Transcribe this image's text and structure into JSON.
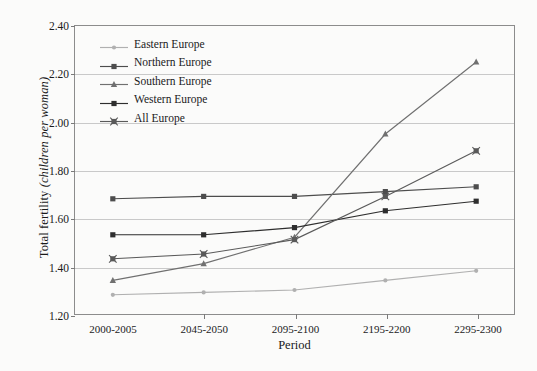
{
  "chart_data": {
    "type": "line",
    "title": "",
    "xlabel": "Period",
    "ylabel": "Total fertility (children per woman)",
    "ylabel_plain": "Total fertility",
    "ylabel_italic": "(children per woman)",
    "categories": [
      "2000-2005",
      "2045-2050",
      "2095-2100",
      "2195-2200",
      "2295-2300"
    ],
    "ylim": [
      1.2,
      2.4
    ],
    "ytick_labels": [
      "1.20",
      "1.40",
      "1.60",
      "1.80",
      "2.00",
      "2.20",
      "2.40"
    ],
    "ytick_values": [
      1.2,
      1.4,
      1.6,
      1.8,
      2.0,
      2.2,
      2.4
    ],
    "grid": true,
    "grid_axis": "y",
    "legend_position": "top-left",
    "series": [
      {
        "name": "Eastern Europe",
        "marker": "dot",
        "color": "#b0b0b0",
        "values": [
          1.28,
          1.29,
          1.3,
          1.34,
          1.38
        ]
      },
      {
        "name": "Northern Europe",
        "marker": "square",
        "color": "#4d4d4d",
        "values": [
          1.68,
          1.69,
          1.69,
          1.71,
          1.73
        ]
      },
      {
        "name": "Southern Europe",
        "marker": "triangle",
        "color": "#707070",
        "values": [
          1.34,
          1.41,
          1.52,
          1.95,
          2.25
        ]
      },
      {
        "name": "Western Europe",
        "marker": "square",
        "color": "#2e2e2e",
        "values": [
          1.53,
          1.53,
          1.56,
          1.63,
          1.67
        ]
      },
      {
        "name": "All Europe",
        "marker": "cross-square",
        "color": "#5a5a5a",
        "values": [
          1.43,
          1.45,
          1.51,
          1.69,
          1.88
        ]
      }
    ]
  }
}
